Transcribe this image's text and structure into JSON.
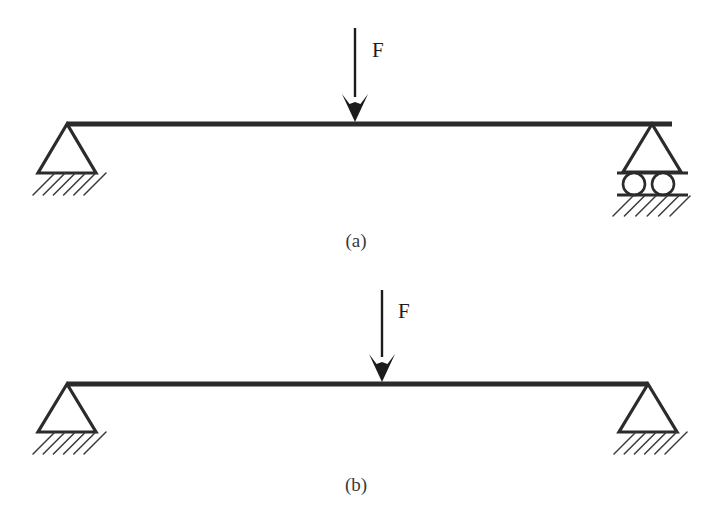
{
  "figure": {
    "background_color": "#ffffff",
    "line_color": "#2b2b2b",
    "hatch_color": "#3a3a3a",
    "panels": [
      {
        "id": "a",
        "caption": "(a)",
        "caption_x": 356,
        "caption_y": 247,
        "description": "Beam on pin support at left and roller support at right",
        "beam": {
          "x1": 67,
          "x2": 672,
          "y": 124,
          "thickness": 5
        },
        "force": {
          "label": "F",
          "label_x": 372,
          "label_y": 57,
          "shaft_x": 355,
          "shaft_top_y": 28,
          "shaft_bottom_y": 97,
          "tip_y": 122,
          "head_half_width": 13,
          "head_notch": 7,
          "shaft_width": 2.4
        },
        "supports": [
          {
            "type": "pin",
            "name": "pin-support-left",
            "apex_x": 67,
            "apex_y": 124,
            "base_y": 173,
            "half_width": 29,
            "hatch": {
              "x1": 33,
              "x2": 106,
              "y": 173,
              "depth": 22,
              "count": 6
            }
          },
          {
            "type": "roller",
            "name": "roller-support-right",
            "apex_x": 652,
            "apex_y": 124,
            "base_y": 172,
            "half_width": 29,
            "plate_top_y": 173,
            "plate_bottom_y": 195,
            "plate_x1": 617,
            "plate_x2": 688,
            "rollers": [
              {
                "cx": 634,
                "cy": 184,
                "r": 11
              },
              {
                "cx": 663,
                "cy": 184,
                "r": 11
              }
            ],
            "hatch": {
              "x1": 613,
              "x2": 690,
              "y": 196,
              "depth": 20,
              "count": 6
            }
          }
        ]
      },
      {
        "id": "b",
        "caption": "(b)",
        "caption_x": 356,
        "caption_y": 491,
        "description": "Beam on pin supports at both left and right ends",
        "beam": {
          "x1": 67,
          "x2": 648,
          "y": 384,
          "thickness": 5
        },
        "force": {
          "label": "F",
          "label_x": 398,
          "label_y": 318,
          "shaft_x": 382,
          "shaft_top_y": 290,
          "shaft_bottom_y": 357,
          "tip_y": 382,
          "head_half_width": 13,
          "head_notch": 7,
          "shaft_width": 2.4
        },
        "supports": [
          {
            "type": "pin",
            "name": "pin-support-left",
            "apex_x": 67,
            "apex_y": 384,
            "base_y": 432,
            "half_width": 29,
            "hatch": {
              "x1": 33,
              "x2": 106,
              "y": 432,
              "depth": 22,
              "count": 6
            }
          },
          {
            "type": "pin",
            "name": "pin-support-right",
            "apex_x": 648,
            "apex_y": 384,
            "base_y": 432,
            "half_width": 29,
            "hatch": {
              "x1": 614,
              "x2": 687,
              "y": 432,
              "depth": 22,
              "count": 6
            }
          }
        ]
      }
    ]
  }
}
